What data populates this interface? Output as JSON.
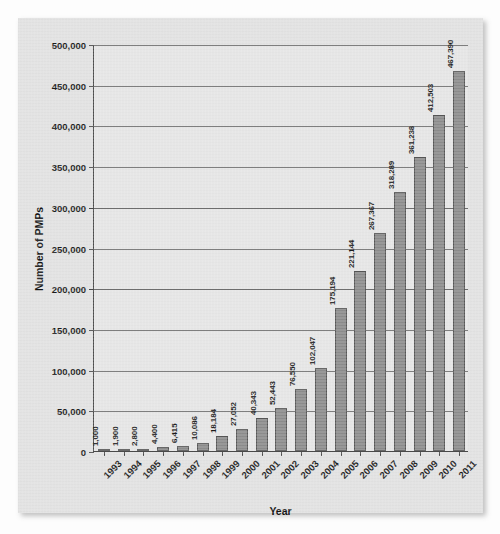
{
  "chart_data": {
    "type": "bar",
    "title": "",
    "xlabel": "Year",
    "ylabel": "Number of PMPs",
    "ylim": [
      0,
      500000
    ],
    "ytick_step": 50000,
    "grid": true,
    "legend": false,
    "bar_color": "#8c8c8c",
    "bar_border_color": "#555555",
    "plot_background": "#e6e6e6",
    "card_background": "#e2e2e2",
    "axis_color": "#4a4a4a",
    "grid_color": "#6e6e6e",
    "categories": [
      "1993",
      "1994",
      "1995",
      "1996",
      "1997",
      "1998",
      "1999",
      "2000",
      "2001",
      "2002",
      "2003",
      "2004",
      "2005",
      "2006",
      "2007",
      "2008",
      "2009",
      "2010",
      "2011"
    ],
    "values": [
      1000,
      1900,
      2800,
      4400,
      6415,
      10086,
      18184,
      27052,
      40343,
      52443,
      76550,
      102047,
      175194,
      221144,
      267367,
      318289,
      361238,
      412503,
      467390
    ],
    "value_labels": [
      "1,000",
      "1,900",
      "2,800",
      "4,400",
      "6,415",
      "10,086",
      "18,184",
      "27,052",
      "40,343",
      "52,443",
      "76,550",
      "102,047",
      "175,194",
      "221,144",
      "267,367",
      "318,289",
      "361,238",
      "412,503",
      "467,390"
    ],
    "ytick_labels": [
      "0",
      "50,000",
      "100,000",
      "150,000",
      "200,000",
      "250,000",
      "300,000",
      "350,000",
      "400,000",
      "450,000",
      "500,000"
    ],
    "ytick_values": [
      0,
      50000,
      100000,
      150000,
      200000,
      250000,
      300000,
      350000,
      400000,
      450000,
      500000
    ]
  }
}
